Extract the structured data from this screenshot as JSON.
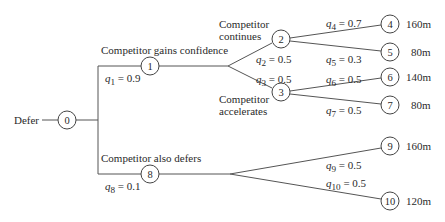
{
  "diagram": {
    "type": "decision-tree",
    "root_label": "Defer",
    "nodes": [
      {
        "id": "0",
        "x": 67,
        "y": 120
      },
      {
        "id": "1",
        "x": 150,
        "y": 66
      },
      {
        "id": "2",
        "x": 281,
        "y": 39
      },
      {
        "id": "3",
        "x": 281,
        "y": 92
      },
      {
        "id": "4",
        "x": 390,
        "y": 24,
        "payoff": "160m"
      },
      {
        "id": "5",
        "x": 390,
        "y": 52,
        "payoff": "80m"
      },
      {
        "id": "6",
        "x": 390,
        "y": 77,
        "payoff": "140m"
      },
      {
        "id": "7",
        "x": 390,
        "y": 105,
        "payoff": "80m"
      },
      {
        "id": "8",
        "x": 150,
        "y": 174
      },
      {
        "id": "9",
        "x": 390,
        "y": 146,
        "payoff": "160m"
      },
      {
        "id": "10",
        "x": 390,
        "y": 201,
        "payoff": "120m"
      }
    ],
    "branches": {
      "competitor_gains_confidence": "Competitor gains confidence",
      "competitor_also_defers": "Competitor also defers",
      "competitor_continues_1": "Competitor",
      "competitor_continues_2": "continues",
      "competitor_accelerates_1": "Competitor",
      "competitor_accelerates_2": "accelerates"
    },
    "probabilities": {
      "q1": {
        "sym": "q",
        "sub": "1",
        "val": " = 0.9"
      },
      "q2": {
        "sym": "q",
        "sub": "2",
        "val": " = 0.5"
      },
      "q3": {
        "sym": "q",
        "sub": "3",
        "val": " = 0.5"
      },
      "q4": {
        "sym": "q",
        "sub": "4",
        "val": " = 0.7"
      },
      "q5": {
        "sym": "q",
        "sub": "5",
        "val": " = 0.3"
      },
      "q6": {
        "sym": "q",
        "sub": "6",
        "val": " = 0.5"
      },
      "q7": {
        "sym": "q",
        "sub": "7",
        "val": " = 0.5"
      },
      "q8": {
        "sym": "q",
        "sub": "8",
        "val": " = 0.1"
      },
      "q9": {
        "sym": "q",
        "sub": "9",
        "val": " = 0.5"
      },
      "q10": {
        "sym": "q",
        "sub": "10",
        "val": " = 0.5"
      }
    },
    "payoffs": {
      "n4": "160m",
      "n5": "80m",
      "n6": "140m",
      "n7": "80m",
      "n9": "160m",
      "n10": "120m"
    },
    "line_color": "#555555"
  }
}
